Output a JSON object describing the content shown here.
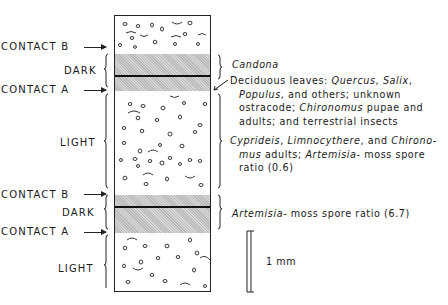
{
  "figure": {
    "type": "stratigraphic-column-diagram",
    "left_labels": [
      {
        "id": "contact_b_1",
        "text": "CONTACT  B",
        "y": 46
      },
      {
        "id": "dark_1",
        "text": "DARK",
        "y": 67
      },
      {
        "id": "contact_a_1",
        "text": "CONTACT  A",
        "y": 86
      },
      {
        "id": "light_1",
        "text": "LIGHT",
        "y": 138
      },
      {
        "id": "contact_b_2",
        "text": "CONTACT  B",
        "y": 187
      },
      {
        "id": "dark_2",
        "text": "DARK",
        "y": 207
      },
      {
        "id": "contact_a_2",
        "text": "CONTACT  A",
        "y": 226
      },
      {
        "id": "light_2",
        "text": "LIGHT",
        "y": 263
      }
    ],
    "labels": {
      "contact_b_1": "CONTACT  B",
      "dark_1": "DARK",
      "contact_a_1": "CONTACT  A",
      "light_1": "LIGHT",
      "contact_b_2": "CONTACT  B",
      "dark_2": "DARK",
      "contact_a_2": "CONTACT  A",
      "light_2": "LIGHT"
    },
    "annotations": {
      "candona": "Candona",
      "deciduous_1": "Deciduous leaves: ",
      "quercus": "Quercus",
      "sep1": ", ",
      "salix": "Salix",
      "sep2": ",",
      "populus": "Populus",
      "deciduous_2": ", and others;  unknown",
      "deciduous_3a": "ostracode; ",
      "chironomus": "Chironomus",
      "deciduous_3b": " pupae and",
      "deciduous_4": "adults;  and terrestrial insects",
      "cyprideis": "Cyprideis",
      "cyp_sep1": ", ",
      "limnocythere": "Limnocythere",
      "cyp_sep2": ", and ",
      "chirono": "Chirono-",
      "mus": "mus",
      "cyp_line2": " adults; ",
      "artemisia_1": "Artemisia",
      "cyp_line2b": "- moss spore",
      "ratio_1": "ratio (0.6)",
      "artemisia_2": "Artemisia",
      "ratio_2": "- moss spore ratio (6.7)"
    },
    "scale_bar": {
      "label": "1 mm"
    },
    "colors": {
      "ink": "#1a1a1a",
      "band_fill": "#c8c8c8",
      "background": "#ffffff"
    }
  }
}
